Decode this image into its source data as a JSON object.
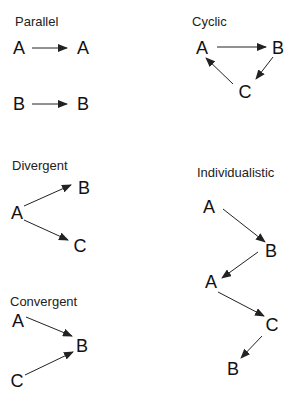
{
  "colors": {
    "background": "#ffffff",
    "text": "#111111",
    "arrow": "#222222"
  },
  "panels": [
    {
      "id": "parallel",
      "title": "Parallel",
      "title_pos": [
        15,
        14
      ],
      "nodes": [
        {
          "label": "A",
          "x": 19,
          "y": 48
        },
        {
          "label": "A",
          "x": 83,
          "y": 48
        },
        {
          "label": "B",
          "x": 19,
          "y": 104
        },
        {
          "label": "B",
          "x": 83,
          "y": 104
        }
      ],
      "edges": [
        {
          "from": 0,
          "to": 1,
          "x1": 32,
          "y1": 48,
          "x2": 67,
          "y2": 48
        },
        {
          "from": 2,
          "to": 3,
          "x1": 32,
          "y1": 104,
          "x2": 67,
          "y2": 104
        }
      ]
    },
    {
      "id": "cyclic",
      "title": "Cyclic",
      "title_pos": [
        192,
        14
      ],
      "nodes": [
        {
          "label": "A",
          "x": 202,
          "y": 48
        },
        {
          "label": "B",
          "x": 278,
          "y": 48
        },
        {
          "label": "C",
          "x": 245,
          "y": 92
        }
      ],
      "edges": [
        {
          "from": 0,
          "to": 1,
          "x1": 217,
          "y1": 47,
          "x2": 266,
          "y2": 47
        },
        {
          "from": 1,
          "to": 2,
          "x1": 273,
          "y1": 57,
          "x2": 256,
          "y2": 79
        },
        {
          "from": 2,
          "to": 0,
          "x1": 233,
          "y1": 84,
          "x2": 206,
          "y2": 58
        }
      ]
    },
    {
      "id": "divergent",
      "title": "Divergent",
      "title_pos": [
        12,
        158
      ],
      "nodes": [
        {
          "label": "A",
          "x": 17,
          "y": 213
        },
        {
          "label": "B",
          "x": 84,
          "y": 188
        },
        {
          "label": "C",
          "x": 80,
          "y": 246
        }
      ],
      "edges": [
        {
          "from": 0,
          "to": 1,
          "x1": 24,
          "y1": 206,
          "x2": 71,
          "y2": 185
        },
        {
          "from": 0,
          "to": 2,
          "x1": 24,
          "y1": 220,
          "x2": 68,
          "y2": 240
        }
      ]
    },
    {
      "id": "convergent",
      "title": "Convergent",
      "title_pos": [
        10,
        294
      ],
      "nodes": [
        {
          "label": "A",
          "x": 18,
          "y": 321
        },
        {
          "label": "B",
          "x": 82,
          "y": 346
        },
        {
          "label": "C",
          "x": 17,
          "y": 381
        }
      ],
      "edges": [
        {
          "from": 0,
          "to": 1,
          "x1": 26,
          "y1": 317,
          "x2": 72,
          "y2": 336
        },
        {
          "from": 2,
          "to": 1,
          "x1": 25,
          "y1": 375,
          "x2": 73,
          "y2": 352
        }
      ]
    },
    {
      "id": "individualistic",
      "title": "Individualistic",
      "title_pos": [
        197,
        165
      ],
      "nodes": [
        {
          "label": "A",
          "x": 209,
          "y": 207
        },
        {
          "label": "B",
          "x": 271,
          "y": 251
        },
        {
          "label": "A",
          "x": 211,
          "y": 282
        },
        {
          "label": "C",
          "x": 272,
          "y": 325
        },
        {
          "label": "B",
          "x": 233,
          "y": 369
        }
      ],
      "edges": [
        {
          "from": 0,
          "to": 1,
          "x1": 223,
          "y1": 209,
          "x2": 265,
          "y2": 242
        },
        {
          "from": 1,
          "to": 2,
          "x1": 258,
          "y1": 252,
          "x2": 222,
          "y2": 278
        },
        {
          "from": 2,
          "to": 3,
          "x1": 218,
          "y1": 292,
          "x2": 264,
          "y2": 316
        },
        {
          "from": 3,
          "to": 4,
          "x1": 262,
          "y1": 336,
          "x2": 241,
          "y2": 358
        }
      ]
    }
  ]
}
